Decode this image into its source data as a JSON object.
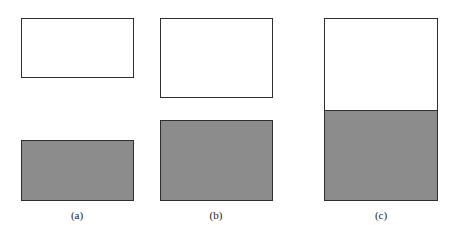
{
  "panels": [
    {
      "label": "(a)",
      "description": "two separated rectangles of equal size, white above gray"
    },
    {
      "label": "(b)",
      "description": "two larger separated rectangles, white above gray, smaller gap"
    },
    {
      "label": "(c)",
      "description": "white rectangle directly adjoining gray rectangle (no gap)"
    }
  ],
  "colors": {
    "fill_gray": "#8c8c8c",
    "border": "#2e2e2e",
    "background": "#ffffff"
  }
}
